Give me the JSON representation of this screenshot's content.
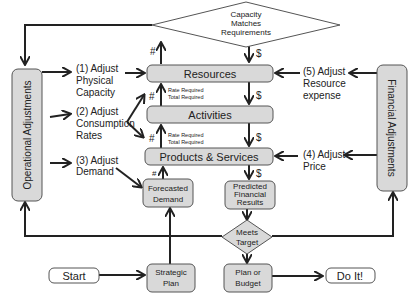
{
  "diagram": {
    "top_decision": {
      "lines": [
        "Capacity",
        "Matches",
        "Requirements"
      ]
    },
    "core_boxes": {
      "resources": "Resources",
      "activities": "Activities",
      "products": "Products & Services"
    },
    "rate_labels": {
      "upper": [
        "Rate Required",
        "Total Required"
      ],
      "lower": [
        "Rate Required",
        "Total Required"
      ]
    },
    "forecasted_demand": [
      "Forecasted",
      "Demand"
    ],
    "predicted_results": [
      "Predicted",
      "Financial",
      "Results"
    ],
    "meets_target": [
      "Meets",
      "Target"
    ],
    "plan_budget": [
      "Plan or",
      "Budget"
    ],
    "strategic_plan": [
      "Strategic",
      "Plan"
    ],
    "start": "Start",
    "do_it": "Do It!",
    "operational_adjustments": "Operational Adjustments",
    "financial_adjustments": "Financial Adjustments",
    "operational_actions": [
      {
        "lines": [
          "(1) Adjust",
          "Physical",
          "Capacity"
        ]
      },
      {
        "lines": [
          "(2) Adjust",
          "Consumption",
          "Rates"
        ]
      },
      {
        "lines": [
          "(3) Adjust",
          "Demand"
        ]
      }
    ],
    "financial_actions": [
      {
        "lines": [
          "(5) Adjust",
          "Resource",
          "expense"
        ]
      },
      {
        "lines": [
          "(4) Adjust",
          "Price"
        ]
      }
    ],
    "symbols": {
      "quantity": "#",
      "money": "$"
    },
    "colors": {
      "box_fill": "#d9d9d9",
      "box_stroke": "#555555",
      "line": "#222222",
      "background": "#ffffff"
    }
  }
}
